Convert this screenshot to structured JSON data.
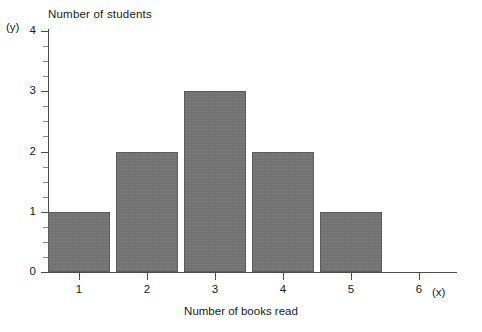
{
  "chart_data": {
    "type": "bar",
    "title": "Number of students",
    "xlabel": "Number of books read",
    "ylabel": "Number of students",
    "axis_name_x": "(x)",
    "axis_name_y": "(y)",
    "categories": [
      "1",
      "2",
      "3",
      "4",
      "5",
      "6"
    ],
    "values": [
      1,
      2,
      3,
      2,
      1,
      0
    ],
    "x_tick_labels": [
      "1",
      "2",
      "3",
      "4",
      "5",
      "6"
    ],
    "y_tick_labels": [
      "0",
      "1",
      "2",
      "3",
      "4"
    ],
    "ylim": [
      0,
      4
    ],
    "y_major_step": 1,
    "y_minor_divisions": 4,
    "grid": false,
    "legend": false,
    "bar_color": "#737373",
    "bar_border_color": "#5c5c5c",
    "axis_color": "#4d4d4d",
    "background_color": "#ffffff"
  }
}
